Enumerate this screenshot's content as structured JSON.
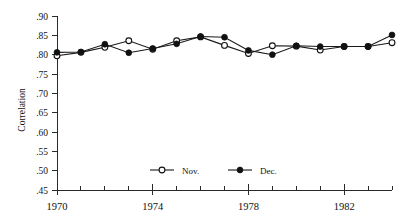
{
  "chart_data": {
    "type": "line",
    "title": "",
    "xlabel": "",
    "ylabel": "Correlation",
    "xlim": [
      1970,
      1984
    ],
    "ylim": [
      0.45,
      0.9
    ],
    "grid": false,
    "legend_position": "bottom-center",
    "x": [
      1970,
      1971,
      1972,
      1973,
      1974,
      1975,
      1976,
      1977,
      1978,
      1979,
      1980,
      1981,
      1982,
      1983,
      1984
    ],
    "xticks": [
      1970,
      1974,
      1978,
      1982
    ],
    "xtick_labels": [
      "1970",
      "1974",
      "1978",
      "1982"
    ],
    "xminor_ticks": [
      1971,
      1972,
      1973,
      1975,
      1976,
      1977,
      1979,
      1980,
      1981,
      1983,
      1984
    ],
    "yticks": [
      0.45,
      0.5,
      0.55,
      0.6,
      0.65,
      0.7,
      0.75,
      0.8,
      0.85,
      0.9
    ],
    "ytick_labels": [
      ".45",
      ".50",
      ".55",
      ".60",
      ".65",
      ".70",
      ".75",
      ".80",
      ".85",
      ".90"
    ],
    "series": [
      {
        "name": "Nov.",
        "marker": "open-circle",
        "values": [
          0.797,
          0.806,
          0.819,
          0.836,
          0.814,
          0.836,
          0.846,
          0.824,
          0.803,
          0.823,
          0.822,
          0.812,
          0.821,
          0.821,
          0.831
        ]
      },
      {
        "name": "Dec.",
        "marker": "filled-circle",
        "values": [
          0.806,
          0.807,
          0.827,
          0.805,
          0.816,
          0.828,
          0.847,
          0.845,
          0.811,
          0.8,
          0.823,
          0.821,
          0.821,
          0.821,
          0.851
        ]
      }
    ]
  },
  "legend": {
    "items": [
      {
        "label": "Nov."
      },
      {
        "label": "Dec."
      }
    ]
  }
}
